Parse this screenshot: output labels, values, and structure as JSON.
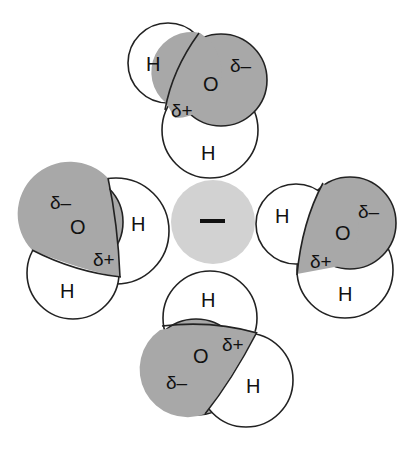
{
  "diagram": {
    "central_ion": {
      "label": "–",
      "charge": "negative",
      "color": "#d2d2d2"
    },
    "colors": {
      "oxygen": "#a8a8a8",
      "hydrogen": "#ffffff",
      "outline": "#222222"
    },
    "molecules": [
      {
        "position": "top",
        "oxygen_label": "O",
        "hydrogen_labels": [
          "H",
          "H"
        ],
        "partial_negative": "δ–",
        "partial_positive": "δ+"
      },
      {
        "position": "left",
        "oxygen_label": "O",
        "hydrogen_labels": [
          "H",
          "H"
        ],
        "partial_negative": "δ–",
        "partial_positive": "δ+"
      },
      {
        "position": "right",
        "oxygen_label": "O",
        "hydrogen_labels": [
          "H",
          "H"
        ],
        "partial_negative": "δ–",
        "partial_positive": "δ+"
      },
      {
        "position": "bottom",
        "oxygen_label": "O",
        "hydrogen_labels": [
          "H",
          "H"
        ],
        "partial_negative": "δ–",
        "partial_positive": "δ+"
      }
    ]
  }
}
